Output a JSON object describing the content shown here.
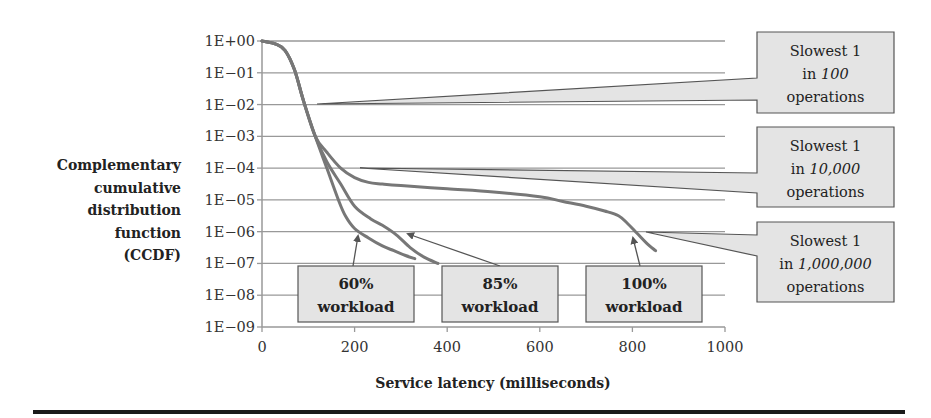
{
  "chart_data": {
    "type": "line",
    "title": "",
    "xlabel": "Service latency (milliseconds)",
    "ylabel": "Complementary cumulative distribution function (CCDF)",
    "ylabel_lines": [
      "Complementary",
      "cumulative",
      "distribution",
      "function",
      "(CCDF)"
    ],
    "xscale": "linear",
    "yscale": "log",
    "xlim": [
      0,
      1000
    ],
    "ylim": [
      1e-09,
      1
    ],
    "grid": {
      "horizontal": true,
      "vertical": false
    },
    "x_ticks": [
      "0",
      "200",
      "400",
      "600",
      "800",
      "1000"
    ],
    "x_tick_values": [
      0,
      200,
      400,
      600,
      800,
      1000
    ],
    "y_ticks": [
      "1E+00",
      "1E−01",
      "1E−02",
      "1E−03",
      "1E−04",
      "1E−05",
      "1E−06",
      "1E−07",
      "1E−08",
      "1E−09"
    ],
    "y_tick_exponents": [
      0,
      -1,
      -2,
      -3,
      -4,
      -5,
      -6,
      -7,
      -8,
      -9
    ],
    "series": [
      {
        "name": "60% workload",
        "x": [
          0,
          30,
          50,
          70,
          90,
          115,
          140,
          165,
          180,
          200,
          230,
          260,
          285,
          310,
          330
        ],
        "log10_y": [
          0,
          -0.1,
          -0.3,
          -0.9,
          -1.9,
          -3.0,
          -4.0,
          -5.0,
          -5.5,
          -5.9,
          -6.2,
          -6.45,
          -6.6,
          -6.75,
          -6.85
        ]
      },
      {
        "name": "85% workload",
        "x": [
          0,
          30,
          50,
          70,
          90,
          115,
          140,
          170,
          200,
          235,
          260,
          290,
          320,
          350,
          380
        ],
        "log10_y": [
          0,
          -0.1,
          -0.3,
          -0.9,
          -1.9,
          -3.0,
          -3.8,
          -4.5,
          -5.2,
          -5.6,
          -5.8,
          -6.1,
          -6.5,
          -6.8,
          -7.0
        ]
      },
      {
        "name": "100% workload",
        "x": [
          0,
          30,
          50,
          70,
          90,
          115,
          140,
          170,
          200,
          230,
          260,
          300,
          400,
          500,
          600,
          650,
          700,
          740,
          770,
          790,
          810,
          830,
          850
        ],
        "log10_y": [
          0,
          -0.1,
          -0.3,
          -0.9,
          -1.9,
          -3.0,
          -3.5,
          -4.0,
          -4.3,
          -4.45,
          -4.5,
          -4.55,
          -4.65,
          -4.75,
          -4.9,
          -5.05,
          -5.2,
          -5.35,
          -5.5,
          -5.75,
          -6.05,
          -6.35,
          -6.6
        ]
      }
    ],
    "annotations": [
      {
        "type": "box",
        "lines": [
          "60%",
          "workload"
        ],
        "points_to": "60% workload"
      },
      {
        "type": "box",
        "lines": [
          "85%",
          "workload"
        ],
        "points_to": "85% workload"
      },
      {
        "type": "box",
        "lines": [
          "100%",
          "workload"
        ],
        "points_to": "100% workload"
      },
      {
        "type": "callout",
        "line1": "Slowest 1",
        "line2_prefix": "in ",
        "line2_italic": "100",
        "line3": "operations",
        "points_to_ccdf": "1E-02"
      },
      {
        "type": "callout",
        "line1": "Slowest 1",
        "line2_prefix": "in ",
        "line2_italic": "10,000",
        "line3": "operations",
        "points_to_ccdf": "1E-04"
      },
      {
        "type": "callout",
        "line1": "Slowest 1",
        "line2_prefix": "in ",
        "line2_italic": "1,000,000",
        "line3": "operations",
        "points_to_ccdf": "1E-06"
      }
    ],
    "legend": null,
    "colors": {
      "curve": "#777777",
      "grid": "#999999",
      "box_fill": "#e4e4e4",
      "box_stroke": "#555555",
      "text": "#222222",
      "rule": "#1a1a1a"
    }
  }
}
